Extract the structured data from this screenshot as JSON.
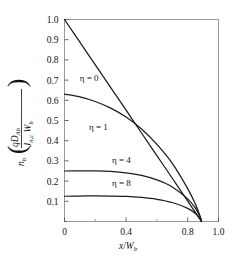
{
  "chart_data": {
    "type": "line",
    "title": "",
    "subtitle": "",
    "xlabel": "x/W_b",
    "ylabel": "n_b ( qD_Ab / ( J_n,c W_b ) )",
    "xlim": [
      0,
      1.0
    ],
    "ylim": [
      0,
      1.0
    ],
    "grid": false,
    "legend_position": "inline-annotations",
    "xticks": [
      0,
      0.2,
      0.4,
      0.6,
      0.8,
      1.0
    ],
    "xticklabels": [
      "0",
      "",
      "0.4",
      "",
      "0.8",
      "1.0"
    ],
    "yticks": [
      0,
      0.1,
      0.2,
      0.3,
      0.4,
      0.5,
      0.6,
      0.7,
      0.8,
      0.9,
      1.0
    ],
    "yticklabels": [
      "",
      "0.1",
      "0.2",
      "0.3",
      "0.4",
      "0.5",
      "0.6",
      "0.7",
      "0.8",
      "0.9",
      "1.0"
    ],
    "convergence_x": 0.89,
    "series": [
      {
        "name": "eta = 0",
        "eta": 0,
        "label": "η = 0",
        "y0": 1.0,
        "x": [
          0.0,
          0.1,
          0.2,
          0.3,
          0.4,
          0.5,
          0.6,
          0.7,
          0.8,
          0.85,
          0.88,
          0.89
        ],
        "values": [
          1.0,
          0.888,
          0.775,
          0.663,
          0.551,
          0.438,
          0.326,
          0.214,
          0.101,
          0.045,
          0.011,
          0.0
        ]
      },
      {
        "name": "eta = 1",
        "eta": 1,
        "label": "η = 1",
        "y0": 0.63,
        "x": [
          0.0,
          0.1,
          0.2,
          0.3,
          0.4,
          0.5,
          0.6,
          0.7,
          0.8,
          0.85,
          0.88,
          0.89
        ],
        "values": [
          0.63,
          0.617,
          0.594,
          0.561,
          0.517,
          0.458,
          0.382,
          0.288,
          0.163,
          0.086,
          0.028,
          0.0
        ]
      },
      {
        "name": "eta = 4",
        "eta": 4,
        "label": "η = 4",
        "y0": 0.25,
        "x": [
          0.0,
          0.1,
          0.2,
          0.3,
          0.4,
          0.5,
          0.6,
          0.7,
          0.8,
          0.85,
          0.88,
          0.89
        ],
        "values": [
          0.25,
          0.251,
          0.251,
          0.248,
          0.241,
          0.228,
          0.206,
          0.171,
          0.112,
          0.066,
          0.023,
          0.0
        ]
      },
      {
        "name": "eta = 8",
        "eta": 8,
        "label": "η = 8",
        "y0": 0.125,
        "x": [
          0.0,
          0.1,
          0.2,
          0.3,
          0.4,
          0.5,
          0.6,
          0.7,
          0.8,
          0.85,
          0.88,
          0.89
        ],
        "values": [
          0.125,
          0.126,
          0.127,
          0.126,
          0.124,
          0.119,
          0.11,
          0.094,
          0.065,
          0.04,
          0.014,
          0.0
        ]
      }
    ],
    "annotations": [
      {
        "text": "η = 0",
        "x": 0.16,
        "y": 0.695
      },
      {
        "text": "η = 1",
        "x": 0.22,
        "y": 0.455
      },
      {
        "text": "η = 4",
        "x": 0.37,
        "y": 0.29
      },
      {
        "text": "η = 8",
        "x": 0.37,
        "y": 0.175
      }
    ],
    "ylabel_parts": {
      "variable": "n",
      "variable_sub": "b",
      "numerator": "qD",
      "numerator_sub": "Ab",
      "denominator_first": "J",
      "denominator_first_sub": "n,c",
      "denominator_second": "W",
      "denominator_second_sub": "b"
    },
    "xlabel_parts": {
      "numerator": "x",
      "denominator": "W",
      "denominator_sub": "b"
    },
    "colors": {
      "curve": "#1c1c1c",
      "frame": "#9a9a9a",
      "background": "#ffffff",
      "text": "#111111"
    }
  }
}
